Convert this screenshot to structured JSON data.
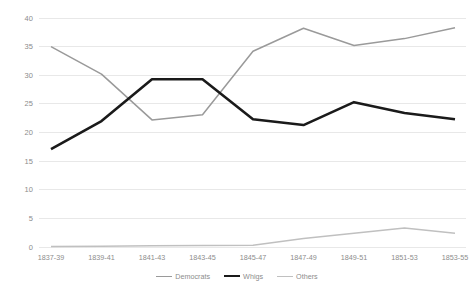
{
  "chart_data": {
    "type": "line",
    "title": "",
    "xlabel": "",
    "ylabel": "",
    "categories": [
      "1837-39",
      "1839-41",
      "1841-43",
      "1843-45",
      "1845-47",
      "1847-49",
      "1849-51",
      "1851-53",
      "1853-55"
    ],
    "series": [
      {
        "name": "Democrats",
        "color": "#9a9a9a",
        "width": 1.5,
        "values": [
          35.0,
          30.2,
          22.2,
          23.1,
          34.2,
          38.2,
          35.2,
          36.4,
          38.3
        ]
      },
      {
        "name": "Whigs",
        "color": "#1a1a1a",
        "width": 2.6,
        "values": [
          17.1,
          22.0,
          29.3,
          29.3,
          22.3,
          21.3,
          25.3,
          23.4,
          22.3
        ]
      },
      {
        "name": "Others",
        "color": "#c0c0c0",
        "width": 1.5,
        "values": [
          0.1,
          0.15,
          0.2,
          0.25,
          0.3,
          1.5,
          2.4,
          3.3,
          2.4
        ]
      }
    ],
    "ylim": [
      0,
      40
    ],
    "yticks": [
      0,
      5,
      10,
      15,
      20,
      25,
      30,
      35,
      40
    ],
    "ytick_labels": [
      "0",
      "5",
      "10",
      "15",
      "20",
      "25",
      "30",
      "35",
      "40"
    ],
    "grid": true,
    "grid_color": "#e8e8e8",
    "legend_position": "bottom"
  }
}
